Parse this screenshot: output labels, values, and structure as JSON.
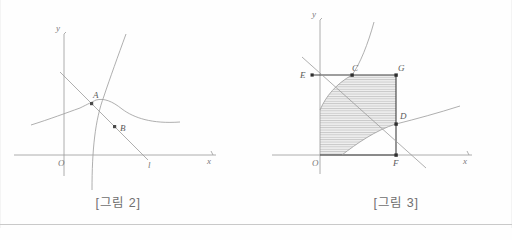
{
  "document": {
    "language": "ko",
    "background_color": "#fefefe",
    "ink_color": "#8a8a8a",
    "dark_ink_color": "#5a5a5a",
    "shade_color": "#d8d8d8"
  },
  "figures": [
    {
      "id": "figure-2",
      "caption": "[그림 2]",
      "axes": {
        "x_label": "x",
        "y_label": "y",
        "origin_label": "O"
      },
      "line_label": "l",
      "points": [
        {
          "label": "A",
          "x": 92,
          "y": 104
        },
        {
          "label": "B",
          "x": 115,
          "y": 127
        }
      ],
      "curves": [
        {
          "name": "exponential-curve",
          "description": "increasing exponential curve through A"
        },
        {
          "name": "logarithmic-curve",
          "description": "increasing logarithmic curve through A"
        },
        {
          "name": "decreasing-line",
          "description": "straight line l through A and B with negative slope"
        },
        {
          "name": "reflected-exponential-curve",
          "description": "curve through B opening right"
        },
        {
          "name": "reflected-logarithmic-curve",
          "description": "curve through B opening up-right"
        }
      ]
    },
    {
      "id": "figure-3",
      "caption": "[그림 3]",
      "axes": {
        "x_label": "x",
        "y_label": "y",
        "origin_label": "O"
      },
      "points": [
        {
          "label": "E",
          "x": 320,
          "y": 75
        },
        {
          "label": "C",
          "x": 352,
          "y": 75
        },
        {
          "label": "G",
          "x": 396,
          "y": 75
        },
        {
          "label": "D",
          "x": 396,
          "y": 124
        },
        {
          "label": "F",
          "x": 396,
          "y": 155
        }
      ],
      "shaded_region": {
        "name": "hatched-region",
        "hatch_style": "horizontal-lines",
        "description": "region bounded by the two curves inside rectangle O-F-G-E"
      },
      "curves": [
        {
          "name": "exponential-curve",
          "description": "increasing exponential curve through C"
        },
        {
          "name": "logarithmic-curve",
          "description": "increasing logarithmic curve through D"
        },
        {
          "name": "decreasing-line",
          "description": "straight line through C and D with negative slope"
        }
      ]
    }
  ]
}
